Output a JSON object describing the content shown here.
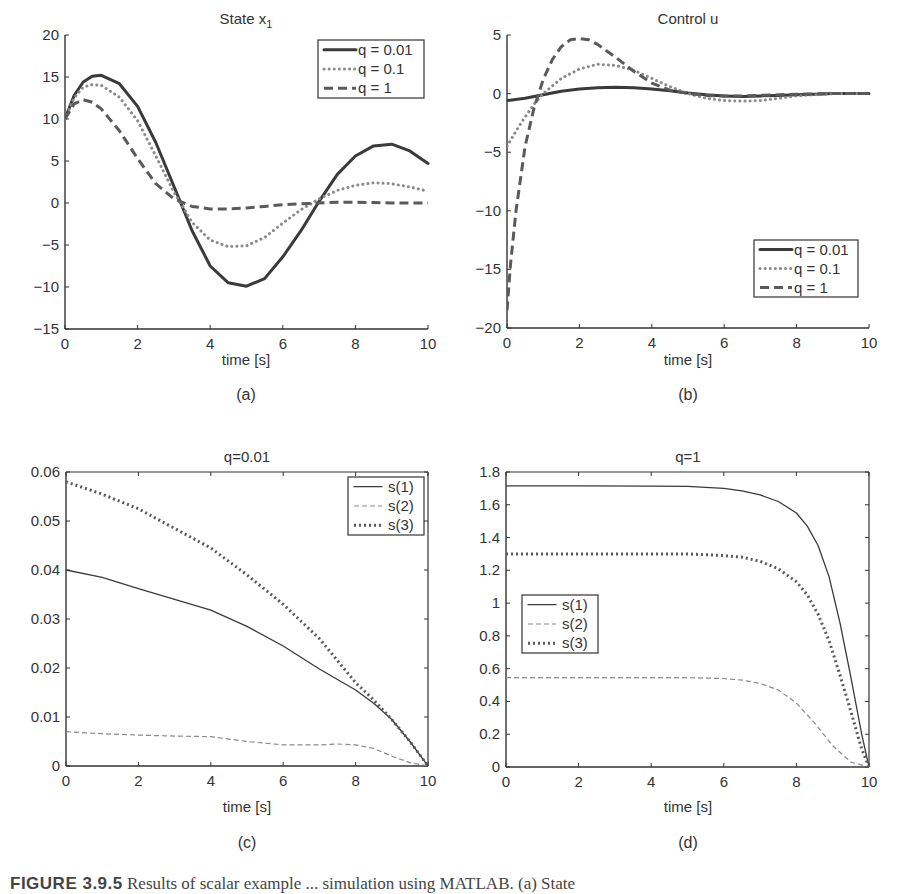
{
  "figure": {
    "caption_visible": "FIGURE 3.9.5  Results of scalar ... in MATLAB. (a) State",
    "caption_label": "FIGURE 3.9.5",
    "caption_text": "Results of scalar example ... simulation using MATLAB. (a) State",
    "colors": {
      "axis": "#333333",
      "solid": "#3a3a3a",
      "dotted": "#8a8a8a",
      "dashed": "#5a5a5a",
      "thin_dashed": "#8a8a8a"
    }
  },
  "chart_data": [
    {
      "id": "a",
      "panel_label": "(a)",
      "type": "line",
      "title": "State x",
      "title_sub": "1",
      "xlabel": "time [s]",
      "ylabel": "",
      "xlim": [
        0,
        10
      ],
      "ylim": [
        -15,
        20
      ],
      "xticks": [
        0,
        2,
        4,
        6,
        8,
        10
      ],
      "yticks": [
        -15,
        -10,
        -5,
        0,
        5,
        10,
        15,
        20
      ],
      "box": false,
      "grid": false,
      "legend_position": "upper right",
      "series": [
        {
          "name": "q = 0.01",
          "style": "solid-thick",
          "x": [
            0,
            0.25,
            0.5,
            0.75,
            1,
            1.5,
            2,
            2.5,
            3,
            3.5,
            4,
            4.5,
            5,
            5.5,
            6,
            6.5,
            7,
            7.5,
            8,
            8.5,
            9,
            9.5,
            10
          ],
          "y": [
            10,
            12.8,
            14.4,
            15.1,
            15.2,
            14.2,
            11.5,
            7.2,
            2.0,
            -3.3,
            -7.5,
            -9.5,
            -9.9,
            -9.0,
            -6.4,
            -3.3,
            0.2,
            3.4,
            5.6,
            6.8,
            7.0,
            6.2,
            4.7
          ]
        },
        {
          "name": "q = 0.1",
          "style": "dotted",
          "x": [
            0,
            0.25,
            0.5,
            0.75,
            1,
            1.5,
            2,
            2.5,
            3,
            3.5,
            4,
            4.5,
            5,
            5.5,
            6,
            6.5,
            7,
            7.5,
            8,
            8.5,
            9,
            9.5,
            10
          ],
          "y": [
            10,
            12.5,
            13.8,
            14.1,
            14.0,
            12.6,
            9.8,
            5.6,
            1.3,
            -2.3,
            -4.4,
            -5.2,
            -5.1,
            -4.1,
            -2.4,
            -0.8,
            0.5,
            1.5,
            2.1,
            2.4,
            2.3,
            1.9,
            1.4
          ]
        },
        {
          "name": "q = 1",
          "style": "dashed",
          "x": [
            0,
            0.25,
            0.5,
            0.75,
            1,
            1.5,
            2,
            2.5,
            3,
            3.5,
            4,
            4.5,
            5,
            5.5,
            6,
            6.5,
            7,
            7.5,
            8,
            8.5,
            9,
            9.5,
            10
          ],
          "y": [
            10,
            11.8,
            12.3,
            12.0,
            11.2,
            8.6,
            5.3,
            2.3,
            0.5,
            -0.4,
            -0.7,
            -0.7,
            -0.6,
            -0.4,
            -0.2,
            -0.1,
            0.0,
            0.1,
            0.1,
            0.05,
            0.0,
            0.0,
            0.0
          ]
        }
      ]
    },
    {
      "id": "b",
      "panel_label": "(b)",
      "type": "line",
      "title": "Control u",
      "title_sub": "",
      "xlabel": "time [s]",
      "ylabel": "",
      "xlim": [
        0,
        10
      ],
      "ylim": [
        -20,
        5
      ],
      "xticks": [
        0,
        2,
        4,
        6,
        8,
        10
      ],
      "yticks": [
        -20,
        -15,
        -10,
        -5,
        0,
        5
      ],
      "box": false,
      "grid": false,
      "legend_position": "lower right",
      "series": [
        {
          "name": "q = 0.01",
          "style": "solid-thick",
          "x": [
            0,
            0.5,
            1,
            1.5,
            2,
            2.5,
            3,
            3.5,
            4,
            4.5,
            5,
            5.5,
            6,
            6.5,
            7,
            7.5,
            8,
            8.5,
            9,
            9.5,
            10
          ],
          "y": [
            -0.6,
            -0.4,
            -0.1,
            0.2,
            0.4,
            0.5,
            0.55,
            0.5,
            0.4,
            0.25,
            0.05,
            -0.1,
            -0.2,
            -0.25,
            -0.2,
            -0.15,
            -0.1,
            -0.05,
            0.0,
            0.0,
            0.0
          ]
        },
        {
          "name": "q = 0.1",
          "style": "dotted",
          "x": [
            0,
            0.25,
            0.5,
            0.75,
            1,
            1.5,
            2,
            2.5,
            3,
            3.5,
            4,
            4.5,
            5,
            5.5,
            6,
            6.5,
            7,
            7.5,
            8,
            8.5,
            9,
            9.5,
            10
          ],
          "y": [
            -4.5,
            -3.2,
            -2.0,
            -0.9,
            0.0,
            1.3,
            2.1,
            2.5,
            2.4,
            2.0,
            1.3,
            0.6,
            0.0,
            -0.4,
            -0.6,
            -0.65,
            -0.6,
            -0.4,
            -0.2,
            -0.1,
            0.0,
            0.0,
            0.0
          ]
        },
        {
          "name": "q = 1",
          "style": "dashed",
          "x": [
            0,
            0.1,
            0.25,
            0.5,
            0.75,
            1,
            1.25,
            1.5,
            1.75,
            2,
            2.25,
            2.5,
            3,
            3.5,
            4,
            4.5,
            5,
            5.5,
            6,
            6.5,
            7,
            7.5,
            8,
            9,
            10
          ],
          "y": [
            -18.5,
            -14.5,
            -10.0,
            -4.5,
            -1.2,
            1.2,
            2.9,
            4.0,
            4.6,
            4.7,
            4.6,
            4.2,
            3.1,
            1.9,
            0.9,
            0.3,
            0.0,
            -0.15,
            -0.2,
            -0.2,
            -0.15,
            -0.1,
            -0.05,
            0.0,
            0.0
          ]
        }
      ]
    },
    {
      "id": "c",
      "panel_label": "(c)",
      "type": "line",
      "title": "q=0.01",
      "title_sub": "",
      "xlabel": "time [s]",
      "ylabel": "",
      "xlim": [
        0,
        10
      ],
      "ylim": [
        0,
        0.06
      ],
      "xticks": [
        0,
        2,
        4,
        6,
        8,
        10
      ],
      "yticks": [
        0,
        0.01,
        0.02,
        0.03,
        0.04,
        0.05,
        0.06
      ],
      "box": true,
      "grid": false,
      "legend_position": "upper right",
      "series": [
        {
          "name": "s(1)",
          "style": "solid-thin",
          "x": [
            0,
            1,
            2,
            3,
            4,
            5,
            6,
            7,
            8,
            8.5,
            9,
            9.5,
            10
          ],
          "y": [
            0.04,
            0.0385,
            0.0362,
            0.034,
            0.0318,
            0.0285,
            0.0245,
            0.0198,
            0.0155,
            0.0128,
            0.0095,
            0.005,
            0.0
          ]
        },
        {
          "name": "s(2)",
          "style": "thin-dashed",
          "x": [
            0,
            1,
            2,
            3,
            4,
            5,
            6,
            7,
            7.5,
            8,
            8.5,
            9,
            9.5,
            10
          ],
          "y": [
            0.007,
            0.0066,
            0.0063,
            0.0061,
            0.006,
            0.005,
            0.0043,
            0.0043,
            0.0045,
            0.0043,
            0.0036,
            0.002,
            0.0007,
            0.0
          ]
        },
        {
          "name": "s(3)",
          "style": "dotted-thick",
          "x": [
            0,
            1,
            2,
            3,
            4,
            5,
            6,
            7,
            7.5,
            8,
            8.5,
            9,
            9.5,
            10
          ],
          "y": [
            0.058,
            0.0555,
            0.0525,
            0.0485,
            0.0445,
            0.039,
            0.033,
            0.026,
            0.0215,
            0.017,
            0.0135,
            0.0095,
            0.005,
            0.0
          ]
        }
      ]
    },
    {
      "id": "d",
      "panel_label": "(d)",
      "type": "line",
      "title": "q=1",
      "title_sub": "",
      "xlabel": "time [s]",
      "ylabel": "",
      "xlim": [
        0,
        10
      ],
      "ylim": [
        0,
        1.8
      ],
      "xticks": [
        0,
        2,
        4,
        6,
        8,
        10
      ],
      "yticks": [
        0,
        0.2,
        0.4,
        0.6,
        0.8,
        1,
        1.2,
        1.4,
        1.6,
        1.8
      ],
      "box": true,
      "grid": false,
      "legend_position": "middle left",
      "series": [
        {
          "name": "s(1)",
          "style": "solid-thin",
          "x": [
            0,
            2,
            4,
            5,
            6,
            6.5,
            7,
            7.5,
            8,
            8.3,
            8.6,
            8.9,
            9.2,
            9.5,
            9.8,
            10
          ],
          "y": [
            1.715,
            1.715,
            1.714,
            1.713,
            1.7,
            1.685,
            1.66,
            1.62,
            1.55,
            1.47,
            1.35,
            1.16,
            0.88,
            0.55,
            0.2,
            0.0
          ]
        },
        {
          "name": "s(2)",
          "style": "thin-dashed",
          "x": [
            0,
            2,
            4,
            5,
            6,
            6.5,
            7,
            7.5,
            8,
            8.5,
            9,
            9.5,
            10
          ],
          "y": [
            0.545,
            0.545,
            0.545,
            0.545,
            0.54,
            0.53,
            0.51,
            0.47,
            0.39,
            0.27,
            0.13,
            0.03,
            0.0
          ]
        },
        {
          "name": "s(3)",
          "style": "dotted-thick",
          "x": [
            0,
            2,
            4,
            5,
            6,
            6.5,
            7,
            7.5,
            8,
            8.3,
            8.6,
            8.9,
            9.2,
            9.5,
            9.8,
            10
          ],
          "y": [
            1.3,
            1.3,
            1.3,
            1.3,
            1.29,
            1.28,
            1.255,
            1.21,
            1.13,
            1.05,
            0.93,
            0.77,
            0.56,
            0.34,
            0.11,
            0.0
          ]
        }
      ]
    }
  ]
}
